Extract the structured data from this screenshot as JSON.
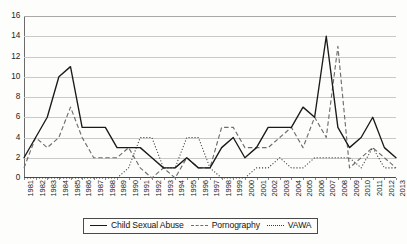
{
  "chart_data": {
    "type": "line",
    "title": "",
    "xlabel": "",
    "ylabel": "",
    "ylim": [
      0,
      16
    ],
    "yticks": [
      0,
      2,
      4,
      6,
      8,
      10,
      12,
      14,
      16
    ],
    "grid": true,
    "legend_position": "bottom-center",
    "x": [
      1981,
      1982,
      1983,
      1984,
      1985,
      1986,
      1987,
      1988,
      1989,
      1990,
      1991,
      1992,
      1993,
      1994,
      1995,
      1996,
      1997,
      1998,
      1999,
      2000,
      2001,
      2002,
      2003,
      2004,
      2005,
      2006,
      2007,
      2008,
      2009,
      2010,
      2011,
      2012,
      2013
    ],
    "categories": [
      "1981",
      "1982",
      "1983",
      "1984",
      "1985",
      "1986",
      "1987",
      "1988",
      "1989",
      "1990",
      "1991",
      "1992",
      "1993",
      "1994",
      "1995",
      "1996",
      "1997",
      "1998",
      "1999",
      "2000",
      "2001",
      "2002",
      "2003",
      "2004",
      "2005",
      "2006",
      "2007",
      "2008",
      "2009",
      "2010",
      "2011",
      "2012",
      "2013"
    ],
    "series": [
      {
        "name": "Child Sexual Abuse",
        "style": "solid",
        "color": "#1a1a1a",
        "values": [
          2,
          4,
          6,
          10,
          11,
          5,
          5,
          5,
          3,
          3,
          3,
          2,
          1,
          1,
          2,
          1,
          1,
          3,
          4,
          2,
          3,
          5,
          5,
          5,
          7,
          6,
          14,
          5,
          3,
          4,
          6,
          3,
          2
        ]
      },
      {
        "name": "Pornography",
        "style": "dashed",
        "color": "#6e6e6e",
        "values": [
          1,
          4,
          3,
          4,
          7,
          4,
          2,
          2,
          2,
          3,
          1,
          0,
          1,
          0,
          2,
          1,
          1,
          5,
          5,
          3,
          3,
          3,
          4,
          5,
          3,
          6,
          4,
          13,
          1,
          2,
          3,
          2,
          1
        ]
      },
      {
        "name": "VAWA",
        "style": "dotted",
        "color": "#3a3a3a",
        "values": [
          0,
          0,
          0,
          0,
          0,
          0,
          0,
          0,
          0,
          1,
          4,
          4,
          1,
          1,
          4,
          4,
          1,
          0,
          0,
          0,
          1,
          1,
          2,
          1,
          1,
          2,
          2,
          2,
          2,
          1,
          3,
          1,
          1
        ]
      }
    ],
    "legend": [
      "Child Sexual Abuse",
      "Pornography",
      "VAWA"
    ]
  },
  "legend": {
    "items": [
      {
        "label": "Child Sexual Abuse",
        "style": "solid"
      },
      {
        "label": "Pornography",
        "style": "dashed"
      },
      {
        "label": "VAWA",
        "style": "dotted"
      }
    ]
  }
}
